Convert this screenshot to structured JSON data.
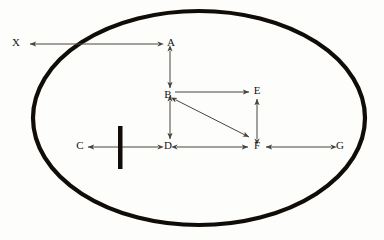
{
  "diagram": {
    "background_color": "#fdfdfb",
    "boundary": {
      "name": "enclosing-ellipse",
      "shape": "ellipse",
      "cx": 199,
      "cy": 118,
      "rx": 166,
      "ry": 107,
      "stroke_color": "#100d09",
      "stroke_width": 4.2,
      "fill": "none"
    },
    "barrier": {
      "name": "vertical-barrier-bar",
      "x": 118,
      "y": 126,
      "width": 4.5,
      "height": 43,
      "color": "#100d09"
    },
    "nodes": [
      {
        "id": "X",
        "label": "X",
        "x": 20,
        "y": 43,
        "inside_boundary": false
      },
      {
        "id": "A",
        "label": "A",
        "x": 172,
        "y": 43,
        "inside_boundary": true
      },
      {
        "id": "B",
        "label": "B",
        "x": 166,
        "y": 95,
        "inside_boundary": true
      },
      {
        "id": "E",
        "label": "E",
        "x": 256,
        "y": 91,
        "inside_boundary": true
      },
      {
        "id": "C",
        "label": "C",
        "x": 79,
        "y": 146,
        "inside_boundary": true
      },
      {
        "id": "D",
        "label": "D",
        "x": 166,
        "y": 146,
        "inside_boundary": true
      },
      {
        "id": "F",
        "label": "F",
        "x": 256,
        "y": 146,
        "inside_boundary": true
      },
      {
        "id": "G",
        "label": "G",
        "x": 339,
        "y": 146,
        "inside_boundary": true
      }
    ],
    "edges": [
      {
        "id": "A-X",
        "from": "A",
        "to": "X",
        "orientation": "horizontal",
        "arrow_start": true,
        "arrow_end": true,
        "x1": 158,
        "y1": 44,
        "x2": 30,
        "y2": 44
      },
      {
        "id": "A-B",
        "from": "A",
        "to": "B",
        "orientation": "vertical",
        "arrow_start": true,
        "arrow_end": true,
        "x1": 170,
        "y1": 51,
        "x2": 170,
        "y2": 88
      },
      {
        "id": "B-E",
        "from": "B",
        "to": "E",
        "orientation": "horizontal",
        "arrow_start": false,
        "arrow_end": true,
        "x1": 175,
        "y1": 92,
        "x2": 249,
        "y2": 92
      },
      {
        "id": "B-F",
        "from": "B",
        "to": "F",
        "orientation": "diagonal",
        "arrow_start": true,
        "arrow_end": true,
        "x1": 175,
        "y1": 100,
        "x2": 249,
        "y2": 137
      },
      {
        "id": "B-D",
        "from": "B",
        "to": "D",
        "orientation": "vertical",
        "arrow_start": true,
        "arrow_end": true,
        "x1": 170,
        "y1": 101,
        "x2": 170,
        "y2": 139
      },
      {
        "id": "D-C",
        "from": "D",
        "to": "C",
        "orientation": "horizontal",
        "arrow_start": true,
        "arrow_end": true,
        "x1": 158,
        "y1": 147,
        "x2": 88,
        "y2": 147,
        "crosses_barrier": true
      },
      {
        "id": "D-F",
        "from": "D",
        "to": "F",
        "orientation": "horizontal",
        "arrow_start": true,
        "arrow_end": true,
        "x1": 177,
        "y1": 147,
        "x2": 248,
        "y2": 147
      },
      {
        "id": "F-E",
        "from": "F",
        "to": "E",
        "orientation": "vertical",
        "arrow_start": true,
        "arrow_end": true,
        "x1": 257,
        "y1": 139,
        "x2": 257,
        "y2": 99
      },
      {
        "id": "G-F",
        "from": "G",
        "to": "F",
        "orientation": "horizontal",
        "arrow_start": true,
        "arrow_end": true,
        "x1": 331,
        "y1": 147,
        "x2": 266,
        "y2": 147
      }
    ],
    "edge_color": "#4a443c",
    "label_color": "#17140f"
  }
}
